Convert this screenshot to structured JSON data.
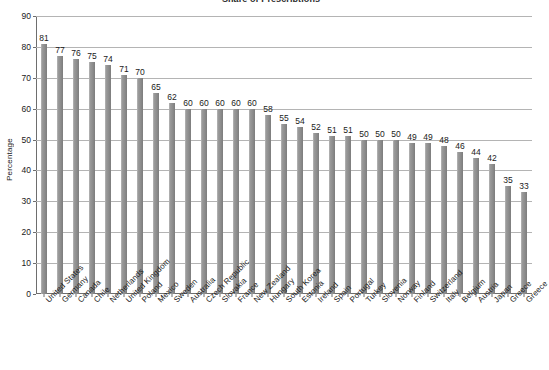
{
  "chart_data": {
    "type": "bar",
    "title": "Share of Prescriptions",
    "xlabel": "",
    "ylabel": "Percentage",
    "ylim": [
      0,
      90
    ],
    "ytick_step": 10,
    "yticks": [
      0,
      10,
      20,
      30,
      40,
      50,
      60,
      70,
      80,
      90
    ],
    "grid": true,
    "legend": null,
    "bar_color": "#8d8d8d",
    "categories": [
      "United States",
      "Germany",
      "Canada",
      "Chile",
      "Netherlands",
      "United Kingdom",
      "Poland",
      "Mexico",
      "Sweden",
      "Australia",
      "Czech Republic",
      "Slovakia",
      "France",
      "New Zealand",
      "Hungary",
      "South Korea",
      "Estonia",
      "Ireland",
      "Spain",
      "Portugal",
      "Turkey",
      "Slovenia",
      "Norway",
      "Finland",
      "Switzerland",
      "Italy",
      "Belgium",
      "Austria",
      "Japan",
      "Greece"
    ],
    "values": [
      81,
      77,
      76,
      75,
      74,
      71,
      70,
      65,
      62,
      60,
      60,
      60,
      60,
      60,
      58,
      55,
      54,
      52,
      51,
      51,
      50,
      50,
      50,
      49,
      49,
      48,
      46,
      44,
      42,
      35
    ],
    "extra_tail": {
      "note": "final category and value rendered from categories/values arrays",
      "last_category": "Greece",
      "last_value": 33
    }
  },
  "axis": {
    "y_title": "Percentage"
  }
}
